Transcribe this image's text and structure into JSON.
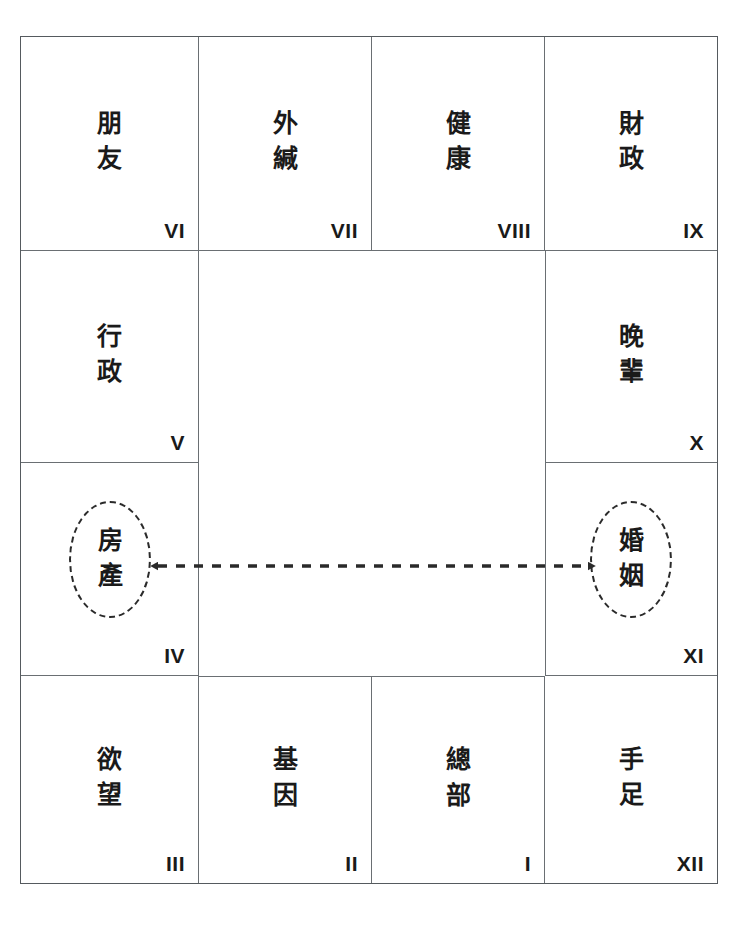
{
  "diagram": {
    "type": "12-palace-grid",
    "background_color": "#ffffff",
    "line_color": "#6a6f73",
    "text_color": "#1a1a1a",
    "highlight_color": "#2a2a2a"
  },
  "cells": [
    {
      "id": "palace-6",
      "name": "朋\n友",
      "index": "VI",
      "pos": "row1-col1"
    },
    {
      "id": "palace-7",
      "name": "外\n緘",
      "index": "VII",
      "pos": "row1-col2"
    },
    {
      "id": "palace-8",
      "name": "健\n康",
      "index": "VIII",
      "pos": "row1-col3"
    },
    {
      "id": "palace-9",
      "name": "財\n政",
      "index": "IX",
      "pos": "row1-col4"
    },
    {
      "id": "palace-5",
      "name": "行\n政",
      "index": "V",
      "pos": "row2-col1"
    },
    {
      "id": "palace-10",
      "name": "晚\n輩",
      "index": "X",
      "pos": "row2-col4"
    },
    {
      "id": "palace-4",
      "name": "房\n產",
      "index": "IV",
      "pos": "row3-col1",
      "highlighted": true
    },
    {
      "id": "palace-11",
      "name": "婚\n姻",
      "index": "XI",
      "pos": "row3-col4",
      "highlighted": true
    },
    {
      "id": "palace-3",
      "name": "欲\n望",
      "index": "III",
      "pos": "row4-col1"
    },
    {
      "id": "palace-2",
      "name": "基\n因",
      "index": "II",
      "pos": "row4-col2"
    },
    {
      "id": "palace-1",
      "name": "總\n部",
      "index": "I",
      "pos": "row4-col3"
    },
    {
      "id": "palace-12",
      "name": "手\n足",
      "index": "XII",
      "pos": "row4-col4"
    }
  ],
  "connection": {
    "style": "dashed",
    "arrowheads": "both",
    "from": "房產",
    "to": "婚姻",
    "from_index": "IV",
    "to_index": "XI"
  }
}
